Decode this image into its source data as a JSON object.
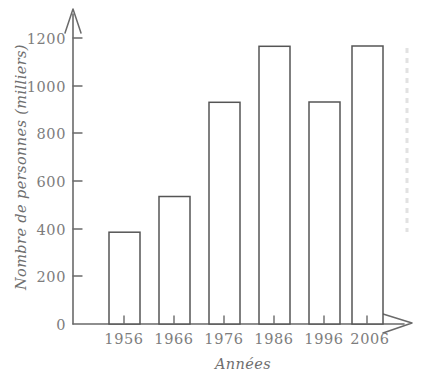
{
  "chart_data": {
    "type": "bar",
    "title": "",
    "subtitle": "",
    "xlabel": "Années",
    "ylabel": "Nombre de personnes (milliers)",
    "categories": [
      "1956",
      "1966",
      "1976",
      "1986",
      "1996",
      "2006"
    ],
    "values": [
      180,
      275,
      385,
      535,
      930,
      1165
    ],
    "ylim": [
      0,
      1250
    ],
    "y_ticks": [
      "0",
      "200",
      "400",
      "600",
      "800",
      "1000",
      "1200"
    ],
    "y_tick_values": [
      0,
      200,
      400,
      600,
      800,
      1000,
      1200
    ],
    "grid": false,
    "legend": null,
    "series": [
      {
        "name": "Nombre de personnes (milliers)",
        "values": [
          180,
          275,
          385,
          535,
          930,
          1165
        ]
      }
    ],
    "style": {
      "bar_fill": "#ffffff",
      "bar_stroke": "#555555",
      "axis_color": "#6a6a6a",
      "text_color": "#7d7d7d",
      "background": "#ffffff"
    }
  },
  "axes": {
    "y_axis_name": "y-axis",
    "x_axis_name": "x-axis",
    "y_arrow": "arrow-up",
    "x_arrow": "arrow-right"
  }
}
